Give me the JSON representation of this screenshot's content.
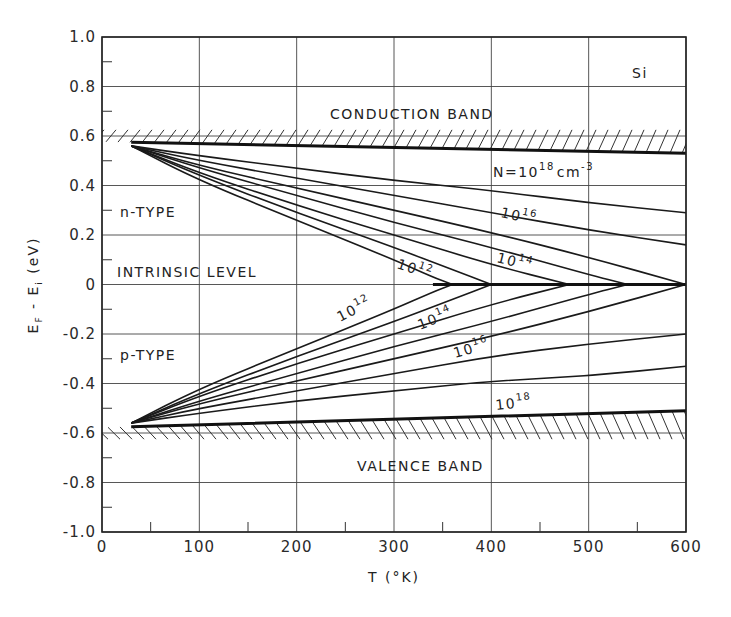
{
  "chart_data": {
    "type": "line",
    "title": "Si",
    "xlabel": "T (°K)",
    "ylabel": "E_F - E_i (eV)",
    "xlim": [
      0,
      600
    ],
    "ylim": [
      -1.0,
      1.0
    ],
    "grid": true,
    "x_ticks": [
      0,
      100,
      200,
      300,
      400,
      500,
      600
    ],
    "x_tick_labels": [
      "0",
      "100",
      "200",
      "300",
      "400",
      "500",
      "600"
    ],
    "y_ticks": [
      1.0,
      0.8,
      0.6,
      0.4,
      0.2,
      0,
      -0.2,
      -0.4,
      -0.6,
      -0.8,
      -1.0
    ],
    "y_tick_labels": [
      "1.0",
      "0.8",
      "0.6",
      "0.4",
      "0.2",
      "0",
      "-0.2",
      "-0.4",
      "-0.6",
      "-0.8",
      "-1.0"
    ],
    "annotations": {
      "material": "Si",
      "conduction_band": "CONDUCTION BAND",
      "valence_band": "VALENCE BAND",
      "intrinsic_level": "INTRINSIC LEVEL",
      "n_type": "n-TYPE",
      "p_type": "p-TYPE",
      "n_label_prefix": "N=10",
      "n_label_exp": "18",
      "n_label_unit": "cm",
      "n_label_unit_exp": "-3",
      "n_curve_labels": [
        {
          "base": "10",
          "exp": "16"
        },
        {
          "base": "10",
          "exp": "14"
        },
        {
          "base": "10",
          "exp": "12"
        }
      ],
      "p_curve_labels": [
        {
          "base": "10",
          "exp": "12"
        },
        {
          "base": "10",
          "exp": "14"
        },
        {
          "base": "10",
          "exp": "16"
        },
        {
          "base": "10",
          "exp": "18"
        }
      ]
    },
    "band_edges": {
      "conduction": {
        "x": [
          30,
          600
        ],
        "y": [
          0.575,
          0.53
        ]
      },
      "valence": {
        "x": [
          30,
          600
        ],
        "y": [
          -0.575,
          -0.51
        ]
      }
    },
    "series_n_type": [
      {
        "name": "1e18",
        "x": [
          30,
          100,
          200,
          300,
          400,
          500,
          600
        ],
        "y": [
          0.56,
          0.52,
          0.47,
          0.42,
          0.38,
          0.33,
          0.29
        ]
      },
      {
        "name": "3e17",
        "x": [
          30,
          100,
          200,
          300,
          400,
          500,
          600
        ],
        "y": [
          0.56,
          0.5,
          0.43,
          0.36,
          0.29,
          0.22,
          0.16
        ]
      },
      {
        "name": "1e16",
        "x": [
          30,
          100,
          200,
          300,
          400,
          500,
          600
        ],
        "y": [
          0.56,
          0.48,
          0.39,
          0.3,
          0.21,
          0.11,
          0.0
        ]
      },
      {
        "name": "3e15",
        "x": [
          30,
          100,
          200,
          300,
          400,
          500,
          540
        ],
        "y": [
          0.56,
          0.47,
          0.36,
          0.25,
          0.15,
          0.04,
          0.0
        ]
      },
      {
        "name": "1e14",
        "x": [
          30,
          100,
          200,
          300,
          400,
          480
        ],
        "y": [
          0.56,
          0.45,
          0.32,
          0.2,
          0.08,
          0.0
        ]
      },
      {
        "name": "3e13",
        "x": [
          30,
          100,
          200,
          300,
          360,
          400
        ],
        "y": [
          0.56,
          0.44,
          0.29,
          0.15,
          0.06,
          0.0
        ]
      },
      {
        "name": "1e12",
        "x": [
          30,
          100,
          200,
          300,
          340,
          360
        ],
        "y": [
          0.56,
          0.42,
          0.26,
          0.1,
          0.03,
          0.0
        ]
      }
    ],
    "series_p_type": [
      {
        "name": "1e12",
        "x": [
          30,
          100,
          200,
          300,
          340,
          360
        ],
        "y": [
          -0.56,
          -0.42,
          -0.26,
          -0.1,
          -0.03,
          0.0
        ]
      },
      {
        "name": "3e13",
        "x": [
          30,
          100,
          200,
          300,
          360,
          400
        ],
        "y": [
          -0.56,
          -0.44,
          -0.29,
          -0.15,
          -0.06,
          0.0
        ]
      },
      {
        "name": "1e14",
        "x": [
          30,
          100,
          200,
          300,
          400,
          480
        ],
        "y": [
          -0.56,
          -0.45,
          -0.32,
          -0.2,
          -0.08,
          0.0
        ]
      },
      {
        "name": "3e15",
        "x": [
          30,
          100,
          200,
          300,
          400,
          500,
          540
        ],
        "y": [
          -0.56,
          -0.47,
          -0.36,
          -0.25,
          -0.15,
          -0.04,
          0.0
        ]
      },
      {
        "name": "1e16",
        "x": [
          30,
          100,
          200,
          300,
          400,
          500,
          600
        ],
        "y": [
          -0.56,
          -0.48,
          -0.39,
          -0.3,
          -0.21,
          -0.11,
          0.0
        ]
      },
      {
        "name": "3e17",
        "x": [
          30,
          100,
          200,
          300,
          400,
          500,
          600
        ],
        "y": [
          -0.56,
          -0.5,
          -0.43,
          -0.36,
          -0.29,
          -0.24,
          -0.2
        ]
      },
      {
        "name": "1e18",
        "x": [
          30,
          100,
          200,
          300,
          400,
          500,
          600
        ],
        "y": [
          -0.56,
          -0.52,
          -0.47,
          -0.43,
          -0.39,
          -0.37,
          -0.33
        ]
      }
    ],
    "intrinsic_line": {
      "x": [
        340,
        600
      ],
      "y": [
        0,
        0
      ]
    }
  }
}
